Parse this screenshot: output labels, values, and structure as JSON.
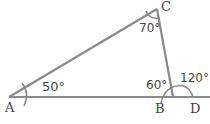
{
  "diagram": {
    "type": "triangle with exterior angle",
    "stroke_color": "#8a8a8a",
    "text_color": "#444444",
    "points": {
      "A": {
        "label": "A"
      },
      "B": {
        "label": "B"
      },
      "C": {
        "label": "C"
      },
      "D": {
        "label": "D"
      }
    },
    "angles": {
      "A": "50°",
      "C": "70°",
      "B_interior": "60°",
      "B_exterior": "120°"
    }
  }
}
